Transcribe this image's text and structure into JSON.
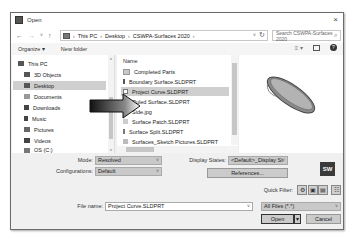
{
  "window": {
    "title": "Open",
    "close_glyph": "×"
  },
  "navigation": {
    "back_glyph": "←",
    "forward_glyph": "→",
    "recent_glyph": "˅",
    "up_glyph": "↑",
    "breadcrumb": [
      "This PC",
      "Desktop",
      "CSWPA-Surfaces 2020"
    ],
    "breadcrumb_sep": "›",
    "dropdown_glyph": "˅",
    "refresh_glyph": "↻",
    "search_placeholder": "Search CSWPA-Surfaces 2020",
    "search_glyph": "⌕"
  },
  "toolbar": {
    "organize_label": "Organize ▾",
    "new_folder_label": "New folder",
    "views_glyph": "≡ ▾",
    "help_glyph": "?"
  },
  "sidebar": {
    "items": [
      {
        "label": "This PC",
        "level": 0,
        "selected": false
      },
      {
        "label": "3D Objects",
        "level": 1,
        "selected": false
      },
      {
        "label": "Desktop",
        "level": 1,
        "selected": true
      },
      {
        "label": "Documents",
        "level": 1,
        "selected": false
      },
      {
        "label": "Downloads",
        "level": 1,
        "selected": false
      },
      {
        "label": "Music",
        "level": 1,
        "selected": false
      },
      {
        "label": "Pictures",
        "level": 1,
        "selected": false
      },
      {
        "label": "Videos",
        "level": 1,
        "selected": false
      },
      {
        "label": "OS (C:)",
        "level": 1,
        "selected": false
      }
    ],
    "scroll_up": "˄",
    "scroll_down": "˅"
  },
  "file_list": {
    "column_header": "Name",
    "items": [
      {
        "name": "Completed Parts",
        "type": "folder",
        "selected": false
      },
      {
        "name": "Boundary Surface.SLDPRT",
        "type": "part",
        "selected": false
      },
      {
        "name": "Project Curve.SLDPRT",
        "type": "part",
        "selected": true
      },
      {
        "name": "Ruled Surface.SLDPRT",
        "type": "part",
        "selected": false
      },
      {
        "name": "Side.jpg",
        "type": "image",
        "selected": false
      },
      {
        "name": "Surface Patch.SLDPRT",
        "type": "part",
        "selected": false
      },
      {
        "name": "Surface Split.SLDPRT",
        "type": "part",
        "selected": false
      },
      {
        "name": "Surfaces_Sketch Pictures.SLDPRT",
        "type": "part",
        "selected": false
      }
    ]
  },
  "preview": {
    "logo_text": "SW"
  },
  "options": {
    "mode_label": "Mode:",
    "mode_value": "Resolved",
    "configurations_label": "Configurations:",
    "configurations_value": "Default",
    "display_states_label": "Display States:",
    "display_states_value": "<Default>_Display St",
    "references_label": "References...",
    "quick_filter_label": "Quick Filter:",
    "quick_filter_glyphs": [
      "⚙",
      "▣",
      "▤",
      "☷"
    ]
  },
  "footer": {
    "file_name_label": "File name:",
    "file_name_value": "Project Curve.SLDPRT",
    "file_type_value": "All Files (*.*)",
    "open_label": "Open",
    "open_split_glyph": "▾",
    "cancel_label": "Cancel",
    "chevron": "˅"
  }
}
